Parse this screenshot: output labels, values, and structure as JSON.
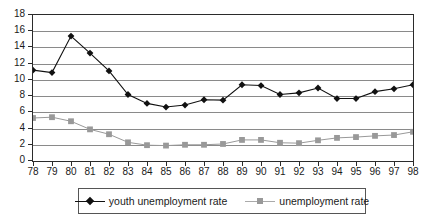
{
  "chart_data": {
    "type": "line",
    "title": "",
    "subtitle": "",
    "xlabel": "",
    "ylabel": "",
    "grid": true,
    "legend_position": "bottom",
    "ylim": [
      0,
      18
    ],
    "ytick_step": 2,
    "yticks": [
      "0",
      "2",
      "4",
      "6",
      "8",
      "10",
      "12",
      "14",
      "16",
      "18"
    ],
    "categories": [
      "78",
      "79",
      "80",
      "81",
      "82",
      "83",
      "84",
      "85",
      "86",
      "87",
      "88",
      "89",
      "90",
      "91",
      "92",
      "93",
      "94",
      "95",
      "96",
      "97",
      "98"
    ],
    "series": [
      {
        "name": "youth unemployment rate",
        "color": "#111111",
        "marker": "diamond",
        "values": [
          11.2,
          10.9,
          15.4,
          13.3,
          11.1,
          8.2,
          7.1,
          6.65,
          6.9,
          7.55,
          7.5,
          9.4,
          9.3,
          8.2,
          8.4,
          9.0,
          7.7,
          7.7,
          8.55,
          8.9,
          9.4
        ]
      },
      {
        "name": "unemployment rate",
        "color": "#999999",
        "marker": "square",
        "values": [
          5.3,
          5.4,
          4.9,
          3.9,
          3.3,
          2.3,
          1.95,
          1.9,
          2.0,
          2.0,
          2.1,
          2.6,
          2.6,
          2.25,
          2.2,
          2.55,
          2.85,
          2.95,
          3.1,
          3.2,
          3.6
        ]
      }
    ]
  },
  "legend": {
    "entries": [
      {
        "label": "youth unemployment rate"
      },
      {
        "label": "unemployment rate"
      }
    ]
  },
  "colors": {
    "series_youth": "#111111",
    "series_total": "#999999",
    "axis": "#2b2b2b",
    "gridline": "#8a8a8a",
    "background": "#ffffff",
    "text": "#1a1a1a"
  }
}
